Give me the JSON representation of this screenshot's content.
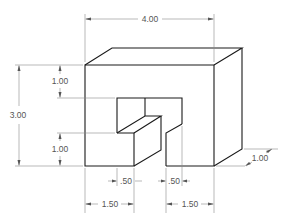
{
  "drawing": {
    "type": "isometric engineering drawing",
    "units": "inches",
    "dimensions": {
      "overall_width": "4.00",
      "overall_height": "3.00",
      "depth": "1.00",
      "top_wall_thickness": "1.00",
      "step_height": "1.00",
      "left_offset": "1.50",
      "right_offset": "1.50",
      "left_slot_gap": ".50",
      "right_slot_gap": ".50"
    },
    "colors": {
      "object_line": "#1a1a1a",
      "dimension_line": "#8a8a8a",
      "dimension_text": "#555555"
    }
  }
}
